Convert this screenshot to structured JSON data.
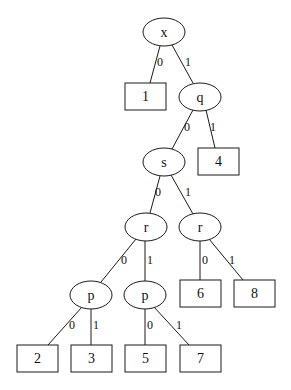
{
  "diagram": {
    "type": "decision-tree",
    "nodes": [
      {
        "id": "n_x",
        "kind": "decision",
        "label": "x",
        "cx": 164,
        "cy": 32,
        "rx": 21,
        "ry": 14
      },
      {
        "id": "n_1",
        "kind": "leaf",
        "label": "1",
        "x": 125,
        "y": 83,
        "w": 41,
        "h": 27
      },
      {
        "id": "n_q",
        "kind": "decision",
        "label": "q",
        "cx": 200,
        "cy": 97,
        "rx": 21,
        "ry": 14
      },
      {
        "id": "n_s",
        "kind": "decision",
        "label": "s",
        "cx": 164,
        "cy": 162,
        "rx": 21,
        "ry": 14
      },
      {
        "id": "n_4",
        "kind": "leaf",
        "label": "4",
        "x": 198,
        "y": 148,
        "w": 41,
        "h": 27
      },
      {
        "id": "n_r0",
        "kind": "decision",
        "label": "r",
        "cx": 146,
        "cy": 227,
        "rx": 21,
        "ry": 14
      },
      {
        "id": "n_r1",
        "kind": "decision",
        "label": "r",
        "cx": 200,
        "cy": 227,
        "rx": 21,
        "ry": 14
      },
      {
        "id": "n_p0",
        "kind": "decision",
        "label": "p",
        "cx": 91,
        "cy": 295,
        "rx": 21,
        "ry": 14
      },
      {
        "id": "n_p1",
        "kind": "decision",
        "label": "p",
        "cx": 145,
        "cy": 295,
        "rx": 21,
        "ry": 14
      },
      {
        "id": "n_6",
        "kind": "leaf",
        "label": "6",
        "x": 180,
        "y": 280,
        "w": 41,
        "h": 27
      },
      {
        "id": "n_8",
        "kind": "leaf",
        "label": "8",
        "x": 234,
        "y": 280,
        "w": 41,
        "h": 27
      },
      {
        "id": "n_2",
        "kind": "leaf",
        "label": "2",
        "x": 17,
        "y": 345,
        "w": 41,
        "h": 27
      },
      {
        "id": "n_3",
        "kind": "leaf",
        "label": "3",
        "x": 71,
        "y": 345,
        "w": 41,
        "h": 27
      },
      {
        "id": "n_5",
        "kind": "leaf",
        "label": "5",
        "x": 125,
        "y": 345,
        "w": 41,
        "h": 27
      },
      {
        "id": "n_7",
        "kind": "leaf",
        "label": "7",
        "x": 180,
        "y": 345,
        "w": 41,
        "h": 27
      }
    ],
    "edges": [
      {
        "from": "n_x",
        "to": "n_1",
        "label": "0",
        "x1": 160,
        "y1": 46,
        "x2": 150,
        "y2": 83,
        "lx": 157,
        "ly": 66
      },
      {
        "from": "n_x",
        "to": "n_q",
        "label": "1",
        "x1": 172,
        "y1": 45,
        "x2": 193,
        "y2": 83,
        "lx": 185,
        "ly": 66
      },
      {
        "from": "n_q",
        "to": "n_s",
        "label": "0",
        "x1": 193,
        "y1": 110,
        "x2": 172,
        "y2": 149,
        "lx": 184,
        "ly": 131
      },
      {
        "from": "n_q",
        "to": "n_4",
        "label": "1",
        "x1": 206,
        "y1": 110,
        "x2": 215,
        "y2": 148,
        "lx": 210,
        "ly": 131
      },
      {
        "from": "n_s",
        "to": "n_r0",
        "label": "0",
        "x1": 160,
        "y1": 176,
        "x2": 150,
        "y2": 213,
        "lx": 155,
        "ly": 196
      },
      {
        "from": "n_s",
        "to": "n_r1",
        "label": "1",
        "x1": 171,
        "y1": 175,
        "x2": 193,
        "y2": 214,
        "lx": 185,
        "ly": 196
      },
      {
        "from": "n_r0",
        "to": "n_p0",
        "label": "0",
        "x1": 136,
        "y1": 239,
        "x2": 101,
        "y2": 282,
        "lx": 121,
        "ly": 264
      },
      {
        "from": "n_r0",
        "to": "n_p1",
        "label": "1",
        "x1": 145,
        "y1": 241,
        "x2": 145,
        "y2": 281,
        "lx": 147,
        "ly": 264
      },
      {
        "from": "n_r1",
        "to": "n_6",
        "label": "0",
        "x1": 200,
        "y1": 241,
        "x2": 200,
        "y2": 280,
        "lx": 202,
        "ly": 264
      },
      {
        "from": "n_r1",
        "to": "n_8",
        "label": "1",
        "x1": 209,
        "y1": 239,
        "x2": 243,
        "y2": 280,
        "lx": 229,
        "ly": 264
      },
      {
        "from": "n_p0",
        "to": "n_2",
        "label": "0",
        "x1": 82,
        "y1": 307,
        "x2": 48,
        "y2": 345,
        "lx": 69,
        "ly": 329
      },
      {
        "from": "n_p0",
        "to": "n_3",
        "label": "1",
        "x1": 91,
        "y1": 309,
        "x2": 91,
        "y2": 345,
        "lx": 93,
        "ly": 329
      },
      {
        "from": "n_p1",
        "to": "n_5",
        "label": "0",
        "x1": 145,
        "y1": 309,
        "x2": 145,
        "y2": 345,
        "lx": 147,
        "ly": 329
      },
      {
        "from": "n_p1",
        "to": "n_7",
        "label": "1",
        "x1": 154,
        "y1": 307,
        "x2": 189,
        "y2": 345,
        "lx": 176,
        "ly": 329
      }
    ]
  }
}
